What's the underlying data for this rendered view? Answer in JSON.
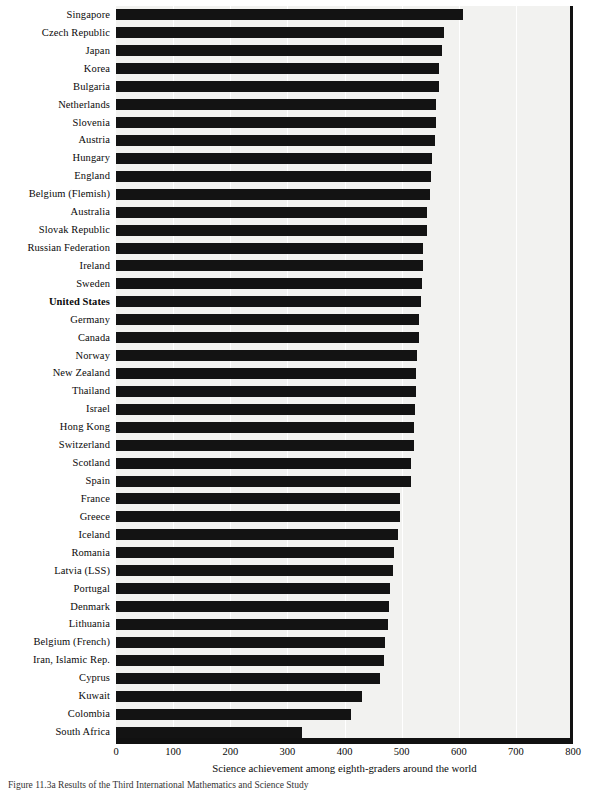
{
  "chart_data": {
    "type": "bar",
    "orientation": "horizontal",
    "title": "",
    "xlabel": "Science achievement among eighth-graders around the world",
    "ylabel": "",
    "xlim": [
      0,
      800
    ],
    "xticks": [
      0,
      100,
      200,
      300,
      400,
      500,
      600,
      700,
      800
    ],
    "grid": true,
    "legend": "none",
    "highlighted_category": "United States",
    "bar_color": "#131313",
    "plot_background": "#f2f2f0",
    "categories": [
      "Singapore",
      "Czech Republic",
      "Japan",
      "Korea",
      "Bulgaria",
      "Netherlands",
      "Slovenia",
      "Austria",
      "Hungary",
      "England",
      "Belgium (Flemish)",
      "Australia",
      "Slovak Republic",
      "Russian Federation",
      "Ireland",
      "Sweden",
      "United States",
      "Germany",
      "Canada",
      "Norway",
      "New Zealand",
      "Thailand",
      "Israel",
      "Hong Kong",
      "Switzerland",
      "Scotland",
      "Spain",
      "France",
      "Greece",
      "Iceland",
      "Romania",
      "Latvia (LSS)",
      "Portugal",
      "Denmark",
      "Lithuania",
      "Belgium (French)",
      "Iran, Islamic Rep.",
      "Cyprus",
      "Kuwait",
      "Colombia",
      "South Africa"
    ],
    "values": [
      607,
      574,
      571,
      565,
      565,
      560,
      560,
      558,
      554,
      552,
      550,
      545,
      544,
      538,
      538,
      535,
      534,
      531,
      531,
      527,
      525,
      525,
      524,
      522,
      522,
      517,
      517,
      498,
      497,
      494,
      486,
      485,
      480,
      478,
      476,
      471,
      470,
      463,
      430,
      411,
      326
    ]
  },
  "axis": {
    "tick_labels": [
      "0",
      "100",
      "200",
      "300",
      "400",
      "500",
      "600",
      "700",
      "800"
    ],
    "x_axis_title": "Science achievement among eighth-graders around the world"
  },
  "caption": {
    "text": "Figure 11.3a  Results of the Third International Mathematics and Science Study"
  }
}
